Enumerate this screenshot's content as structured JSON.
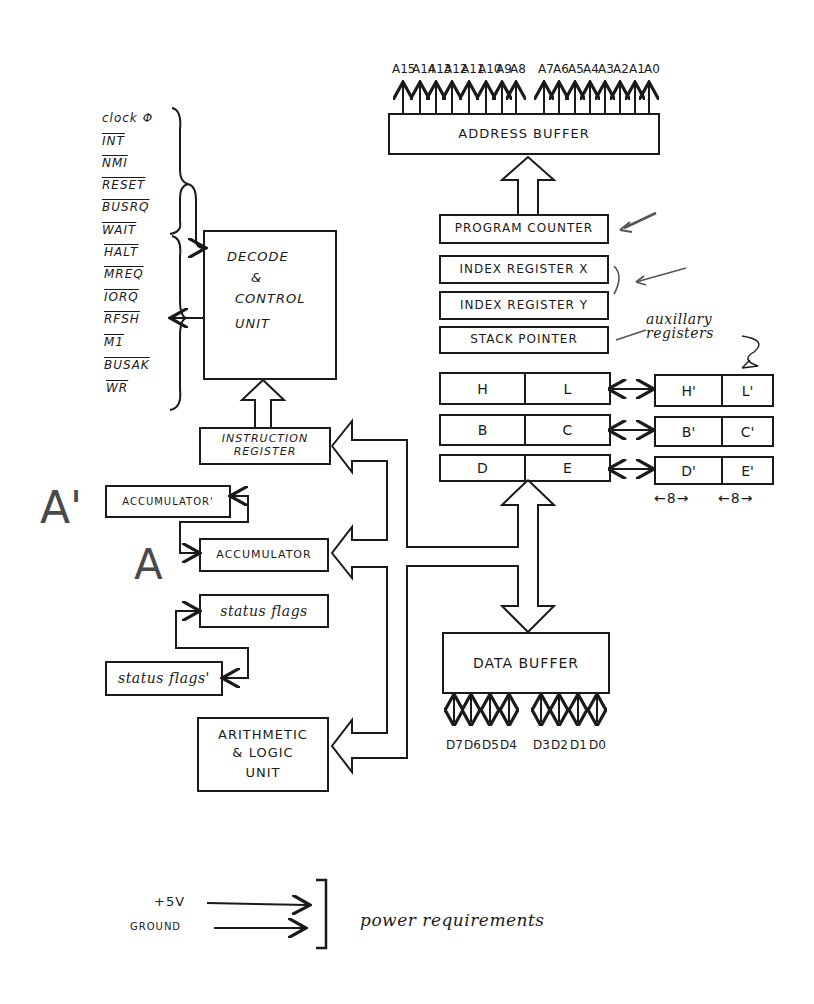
{
  "address_buffer": {
    "label": "ADDRESS BUFFER",
    "pins": [
      "A15",
      "A14",
      "A13",
      "A12",
      "A11",
      "A10",
      "A9",
      "A8",
      "A7",
      "A6",
      "A5",
      "A4",
      "A3",
      "A2",
      "A1",
      "A0"
    ]
  },
  "control_signals": {
    "inputs": [
      "clock Φ",
      "INT",
      "NMI",
      "RESET",
      "BUSRQ",
      "WAIT"
    ],
    "outputs": [
      "HALT",
      "MREQ",
      "IORQ",
      "RFSH",
      "M1",
      "BUSAK",
      "WR"
    ]
  },
  "decode_control": {
    "line1": "DECODE",
    "line2": "&",
    "line3": "CONTROL",
    "line4": "UNIT"
  },
  "instruction_register": {
    "line1": "INSTRUCTION",
    "line2": "REGISTER"
  },
  "registers_16bit": [
    {
      "label": "PROGRAM COUNTER"
    },
    {
      "label": "INDEX REGISTER X"
    },
    {
      "label": "INDEX REGISTER Y"
    },
    {
      "label": "STACK POINTER"
    }
  ],
  "register_pairs": [
    {
      "hi": "H",
      "lo": "L",
      "alt_hi": "H'",
      "alt_lo": "L'"
    },
    {
      "hi": "B",
      "lo": "C",
      "alt_hi": "B'",
      "alt_lo": "C'"
    },
    {
      "hi": "D",
      "lo": "E",
      "alt_hi": "D'",
      "alt_lo": "E'"
    }
  ],
  "bit_widths": {
    "left": "←8→",
    "right": "←8→"
  },
  "annotations": {
    "auxiliary_registers": "auxillary registers",
    "big_a_prime": "A'",
    "big_a": "A"
  },
  "accumulators": {
    "alt": "ACCUMULATOR'",
    "main": "ACCUMULATOR"
  },
  "status_flags": {
    "main": "status flags",
    "alt": "status flags'"
  },
  "alu": {
    "line1": "ARITHMETIC",
    "line2": "& LOGIC",
    "line3": "UNIT"
  },
  "data_buffer": {
    "label": "DATA BUFFER",
    "pins": [
      "D7",
      "D6",
      "D5",
      "D4",
      "D3",
      "D2",
      "D1",
      "D0"
    ]
  },
  "power": {
    "plus5v": "+5V",
    "ground": "GROUND",
    "label": "power requirements"
  }
}
